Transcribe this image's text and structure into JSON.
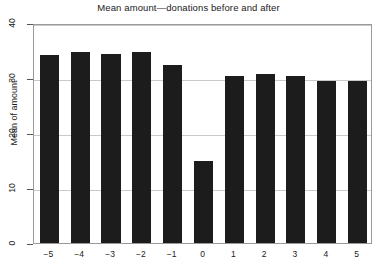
{
  "chart_data": {
    "type": "bar",
    "title": "Mean amount—donations before and after",
    "xlabel": "",
    "ylabel": "Mean of amount",
    "categories": [
      "−5",
      "−4",
      "−3",
      "−2",
      "−1",
      "0",
      "1",
      "2",
      "3",
      "4",
      "5"
    ],
    "values": [
      34.2,
      34.8,
      34.4,
      34.8,
      32.4,
      15.0,
      30.3,
      30.7,
      30.3,
      29.5,
      29.5
    ],
    "ylim": [
      0,
      40
    ],
    "yticks": [
      0,
      10,
      20,
      30,
      40
    ],
    "ytick_labels": [
      "0",
      "10",
      "20",
      "30",
      "40"
    ],
    "grid": true,
    "legend": "none",
    "bar_color": "#1c1c1c",
    "grid_color": "#c9c9c9",
    "frame_color": "#9a9a9a"
  }
}
